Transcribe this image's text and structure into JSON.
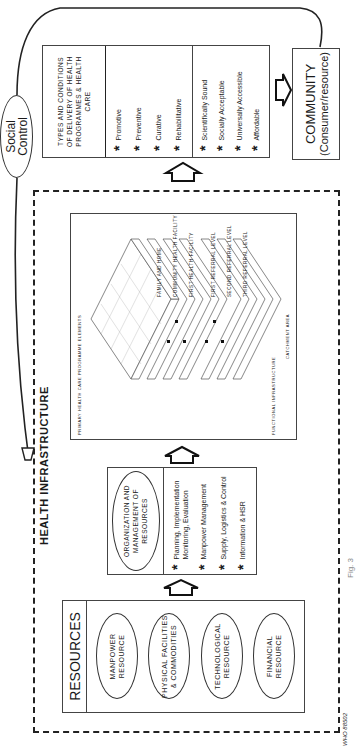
{
  "title": "HEALTH INFRASTRUCTURE",
  "social_control": {
    "line1": "Social",
    "line2": "Control"
  },
  "resources": {
    "header": "RESOURCES",
    "items": [
      "MANPOWER RESOURCE",
      "PHYSICAL FACILITIES & COMMODITIES",
      "TECHNOLOGICAL RESOURCE",
      "FINANCIAL RESOURCE"
    ]
  },
  "organization": {
    "header": "ORGANIZATION AND MANAGEMENT OF RESOURCES",
    "items": [
      "Planning, Implementation Monitoring, Evaluation",
      "Manpower Management",
      "Supply, Logistics & Control",
      "Information & HSR"
    ]
  },
  "infrastructure_diagram": {
    "top_left_label": "Primary health care programme elements",
    "top_right_label": "Functional infrastructure",
    "bottom_label": "Catchment area",
    "layers": [
      "FAMILY AND HOME",
      "COMMUNITY HEALTH FACILITY",
      "FIRST HEALTH FACILITY",
      "FIRST REFERRAL LEVEL",
      "SECOND REFERRAL LEVEL",
      "THIRD REFERRAL LEVEL"
    ]
  },
  "types": {
    "header": "TYPES AND CONDITIONS OF DELIVERY OF HEALTH PROGRAMMES & HEALTH CARE",
    "types_items": [
      "Promotive",
      "Preventive",
      "Curative",
      "Rehabilitative"
    ],
    "conditions_items": [
      "Scientifically Sound",
      "Socially Acceptable",
      "Universally Accessible",
      "Affordable"
    ]
  },
  "community": {
    "line1": "COMMUNITY",
    "line2": "(Consumer/resource)"
  },
  "caption": "Fig. 3",
  "figure_id": "WHO  88502"
}
